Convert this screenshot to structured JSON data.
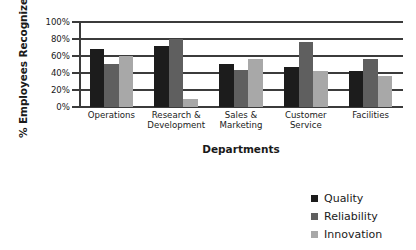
{
  "chart_data": {
    "type": "bar",
    "title": "",
    "subtitle": "",
    "xlabel": "Departments",
    "ylabel": "% Employees Recognized",
    "categories": [
      "Operations",
      "Research & Development",
      "Sales & Marketing",
      "Customer Service",
      "Facilities"
    ],
    "category_lines": [
      [
        "Operations"
      ],
      [
        "Research &",
        "Development"
      ],
      [
        "Sales &",
        "Marketing"
      ],
      [
        "Customer",
        "Service"
      ],
      [
        "Facilities"
      ]
    ],
    "series": [
      {
        "name": "Quality",
        "color": "#1c1c1c",
        "values": [
          68,
          72,
          51,
          47,
          42
        ]
      },
      {
        "name": "Reliability",
        "color": "#5f5f5f",
        "values": [
          51,
          80,
          43,
          77,
          56
        ]
      },
      {
        "name": "Innovation",
        "color": "#a8a8a8",
        "values": [
          60,
          10,
          56,
          42,
          37
        ]
      }
    ],
    "ylim": [
      0,
      100
    ],
    "ytick_values": [
      0,
      20,
      40,
      60,
      80,
      100
    ],
    "ytick_labels": [
      "0%",
      "20%",
      "40%",
      "60%",
      "80%",
      "100%"
    ],
    "grid": true,
    "grid_axis": "y",
    "legend_position": "bottom-right",
    "axis_color": "#3b3b3b",
    "background_color": "#ffffff"
  },
  "legend": {
    "items": [
      {
        "label": "Quality"
      },
      {
        "label": "Reliability"
      },
      {
        "label": "Innovation"
      }
    ]
  }
}
